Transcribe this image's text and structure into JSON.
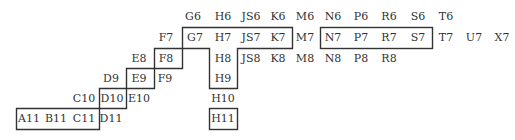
{
  "diagram": {
    "type": "grid-label-chart",
    "line_color": "#333333",
    "text_color": "#333333",
    "rows": [
      {
        "row": 6,
        "labels": [
          "G6",
          "H6",
          "JS6",
          "K6",
          "M6",
          "N6",
          "P6",
          "R6",
          "S6",
          "T6"
        ]
      },
      {
        "row": 7,
        "labels": [
          "F7",
          "G7",
          "H7",
          "JS7",
          "K7",
          "M7",
          "N7",
          "P7",
          "R7",
          "S7",
          "T7",
          "U7",
          "X7"
        ]
      },
      {
        "row": 8,
        "labels": [
          "E8",
          "F8",
          "H8",
          "JS8",
          "K8",
          "M8",
          "N8",
          "P8",
          "R8"
        ]
      },
      {
        "row": 9,
        "labels": [
          "D9",
          "E9",
          "F9",
          "H9"
        ]
      },
      {
        "row": 10,
        "labels": [
          "C10",
          "D10",
          "E10",
          "H10"
        ]
      },
      {
        "row": 11,
        "labels": [
          "A11",
          "B11",
          "C11",
          "D11",
          "H11"
        ]
      }
    ],
    "outlined_regions": [
      {
        "name": "staircase-region",
        "cells": [
          "A11",
          "B11",
          "C11",
          "D10",
          "E9",
          "F8",
          "G7",
          "H7",
          "H8",
          "H9",
          "JS7",
          "K7"
        ]
      },
      {
        "name": "n7-s7-box",
        "cells": [
          "N7",
          "P7",
          "R7",
          "S7"
        ]
      },
      {
        "name": "h11-box",
        "cells": [
          "H11"
        ]
      }
    ]
  },
  "cells": [
    {
      "id": "G6",
      "x": 193,
      "y": 16
    },
    {
      "id": "H6",
      "x": 223,
      "y": 16
    },
    {
      "id": "JS6",
      "x": 251,
      "y": 16
    },
    {
      "id": "K6",
      "x": 278,
      "y": 16
    },
    {
      "id": "M6",
      "x": 305,
      "y": 16
    },
    {
      "id": "N6",
      "x": 333,
      "y": 16
    },
    {
      "id": "P6",
      "x": 361,
      "y": 16
    },
    {
      "id": "R6",
      "x": 389,
      "y": 16
    },
    {
      "id": "S6",
      "x": 418,
      "y": 16
    },
    {
      "id": "T6",
      "x": 446,
      "y": 16
    },
    {
      "id": "F7",
      "x": 166,
      "y": 37
    },
    {
      "id": "G7",
      "x": 195,
      "y": 37
    },
    {
      "id": "H7",
      "x": 223,
      "y": 37
    },
    {
      "id": "JS7",
      "x": 251,
      "y": 37
    },
    {
      "id": "K7",
      "x": 278,
      "y": 37
    },
    {
      "id": "M7",
      "x": 305,
      "y": 37
    },
    {
      "id": "N7",
      "x": 333,
      "y": 37
    },
    {
      "id": "P7",
      "x": 361,
      "y": 37
    },
    {
      "id": "R7",
      "x": 389,
      "y": 37
    },
    {
      "id": "S7",
      "x": 418,
      "y": 37
    },
    {
      "id": "T7",
      "x": 446,
      "y": 37
    },
    {
      "id": "U7",
      "x": 474,
      "y": 37
    },
    {
      "id": "X7",
      "x": 502,
      "y": 37
    },
    {
      "id": "E8",
      "x": 139,
      "y": 58
    },
    {
      "id": "F8",
      "x": 166,
      "y": 58
    },
    {
      "id": "H8",
      "x": 223,
      "y": 58
    },
    {
      "id": "JS8",
      "x": 251,
      "y": 58
    },
    {
      "id": "K8",
      "x": 278,
      "y": 58
    },
    {
      "id": "M8",
      "x": 305,
      "y": 58
    },
    {
      "id": "N8",
      "x": 333,
      "y": 58
    },
    {
      "id": "P8",
      "x": 361,
      "y": 58
    },
    {
      "id": "R8",
      "x": 389,
      "y": 58
    },
    {
      "id": "D9",
      "x": 111,
      "y": 78
    },
    {
      "id": "E9",
      "x": 139,
      "y": 78
    },
    {
      "id": "F9",
      "x": 165,
      "y": 78
    },
    {
      "id": "H9",
      "x": 223,
      "y": 78
    },
    {
      "id": "C10",
      "x": 84,
      "y": 98
    },
    {
      "id": "D10",
      "x": 112,
      "y": 98
    },
    {
      "id": "E10",
      "x": 139,
      "y": 98
    },
    {
      "id": "H10",
      "x": 223,
      "y": 98
    },
    {
      "id": "A11",
      "x": 29,
      "y": 118
    },
    {
      "id": "B11",
      "x": 56,
      "y": 118
    },
    {
      "id": "C11",
      "x": 84,
      "y": 118
    },
    {
      "id": "D11",
      "x": 111,
      "y": 118
    },
    {
      "id": "H11",
      "x": 223,
      "y": 118
    }
  ]
}
